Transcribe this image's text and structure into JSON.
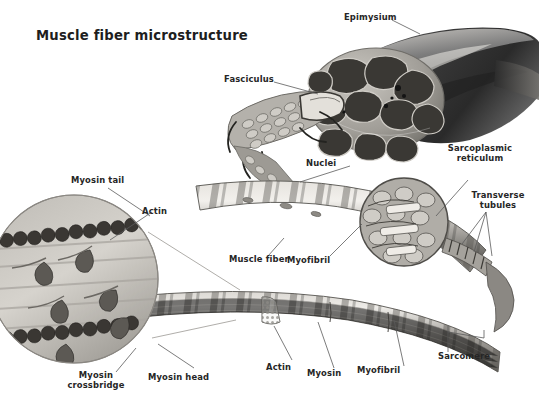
{
  "figure": {
    "title": "Muscle fiber microstructure",
    "domain": "anatomical-illustration",
    "style": "grayscale-airbrush-medical-illustration",
    "background_color": "#ffffff",
    "label_color": "#262626",
    "leader_line_color": "#5a5a5a"
  },
  "labels": {
    "epimysium": "Epimysium",
    "fasciculus": "Fasciculus",
    "nuclei": "Nuclei",
    "sarcoplasmic_reticulum_line1": "Sarcoplasmic",
    "sarcoplasmic_reticulum_line2": "reticulum",
    "transverse_line1": "Transverse",
    "transverse_line2": "tubules",
    "muscle_fiber": "Muscle fiber",
    "myofibril_mid": "Myofibril",
    "myosin_tail": "Myosin tail",
    "actin_inset": "Actin",
    "myosin_crossbridge_line1": "Myosin",
    "myosin_crossbridge_line2": "crossbridge",
    "myosin_head": "Myosin head",
    "actin_bottom": "Actin",
    "myosin_bottom": "Myosin",
    "myofibril_bottom": "Myofibril",
    "sarcomere": "Sarcomere"
  },
  "structures": [
    {
      "name": "muscle-belly",
      "description": "whole muscle tapering to tendon, cut open to reveal fascicles"
    },
    {
      "name": "fascicle-cross-section",
      "description": "bundle of dark polygonal fascicles wrapped in perimysium"
    },
    {
      "name": "fasciculus-bundle",
      "description": "extracted fasciculus showing individual muscle fibers"
    },
    {
      "name": "muscle-fiber-cylinder",
      "description": "striated single muscle fiber with peripheral nuclei"
    },
    {
      "name": "myofibril-cross-section",
      "description": "cut end showing myofibrils, sarcoplasmic reticulum and T-tubules"
    },
    {
      "name": "myofibril-strand",
      "description": "long banded myofibril showing sarcomeres"
    },
    {
      "name": "sarcomere-inset-circle",
      "description": "magnified circular inset of thick and thin filaments"
    }
  ],
  "colors": {
    "ink_dark": "#2b2b2b",
    "tissue_mid": "#8c8c8c",
    "tissue_light": "#d8d6d2",
    "highlight": "#f2f0ec",
    "shadow": "#4a4a4a"
  }
}
